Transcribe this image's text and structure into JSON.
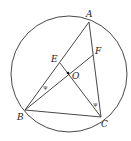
{
  "diagram": {
    "type": "geometry",
    "circle": {
      "center": "O",
      "cx": 69,
      "cy": 74,
      "r": 58
    },
    "points": {
      "A": {
        "label": "A",
        "x": 89,
        "y": 22
      },
      "B": {
        "label": "B",
        "x": 25,
        "y": 110
      },
      "C": {
        "label": "C",
        "x": 101,
        "y": 117
      },
      "O": {
        "label": "O",
        "x": 68,
        "y": 73
      },
      "E": {
        "label": "E",
        "x": 60,
        "y": 63
      },
      "F": {
        "label": "F",
        "x": 93,
        "y": 55
      }
    },
    "segments": [
      "AB",
      "AC",
      "BC",
      "BF",
      "CE"
    ],
    "angle_marks": [
      {
        "vertex": "B",
        "between": [
          "A",
          "F"
        ],
        "symbol": "ψ"
      },
      {
        "vertex": "C",
        "between": [
          "A",
          "E"
        ],
        "symbol": "ψ"
      }
    ],
    "colors": {
      "stroke": "#333333",
      "background": "#ffffff"
    }
  }
}
